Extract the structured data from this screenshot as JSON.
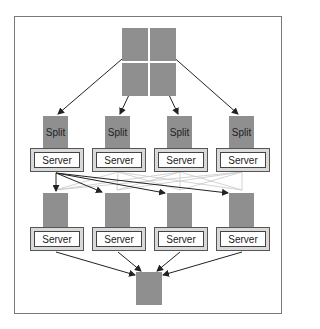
{
  "diagram": {
    "input": {
      "name": "input-data-grid",
      "tiles": 4
    },
    "splits": [
      {
        "label": "Split"
      },
      {
        "label": "Split"
      },
      {
        "label": "Split"
      },
      {
        "label": "Split"
      }
    ],
    "map_servers": [
      {
        "label": "Server"
      },
      {
        "label": "Server"
      },
      {
        "label": "Server"
      },
      {
        "label": "Server"
      }
    ],
    "intermediate": [
      {
        "label": ""
      },
      {
        "label": ""
      },
      {
        "label": ""
      },
      {
        "label": ""
      }
    ],
    "reduce_servers": [
      {
        "label": "Server"
      },
      {
        "label": "Server"
      },
      {
        "label": "Server"
      },
      {
        "label": "Server"
      }
    ],
    "output": {
      "name": "output-data"
    },
    "colors": {
      "block": "#8f8f8f",
      "arrow": "#222222",
      "shuffle_line": "#c8c8c8",
      "frame": "#7a7a7a"
    }
  }
}
